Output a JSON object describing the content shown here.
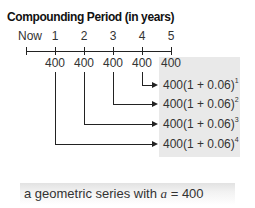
{
  "title": "Compounding Period (in years)",
  "timeline": {
    "labels": [
      "Now",
      "1",
      "2",
      "3",
      "4",
      "5"
    ],
    "payments": [
      "400",
      "400",
      "400",
      "400",
      "400"
    ]
  },
  "expressions": [
    {
      "base": "400(1 + 0.06)",
      "exp": "1"
    },
    {
      "base": "400(1 + 0.06)",
      "exp": "2"
    },
    {
      "base": "400(1 + 0.06)",
      "exp": "3"
    },
    {
      "base": "400(1 + 0.06)",
      "exp": "4"
    }
  ],
  "caption": {
    "prefix": "a geometric series with ",
    "var": "a",
    "suffix": " = 400"
  },
  "colors": {
    "shade": "#e9e9e9",
    "line": "#222222"
  }
}
